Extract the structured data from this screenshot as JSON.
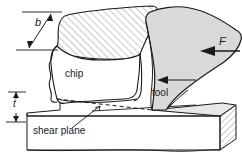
{
  "figure": {
    "width": 242,
    "height": 159,
    "background_color": "#ffffff",
    "line_color": "#1a1a1a",
    "tool_fill_color": "#d9d9d9",
    "chip_fill_color": "#ffffff",
    "workpiece_fill_color": "#ffffff",
    "hatch_color": "#808080"
  },
  "labels": {
    "width_dimension": "b",
    "thickness_dimension": "t",
    "force": "F",
    "chip": "chip",
    "tool": "tool",
    "shear_plane": "shear plane"
  },
  "annotations": {
    "width_dimension_name": "chip-width-dimension-b",
    "thickness_dimension_name": "uncut-chip-thickness-t",
    "force_arrow_name": "cutting-force-arrow-F",
    "tool_motion_arrow_name": "tool-motion-arrow",
    "shear_plane_leader_name": "shear-plane-leader-line"
  }
}
